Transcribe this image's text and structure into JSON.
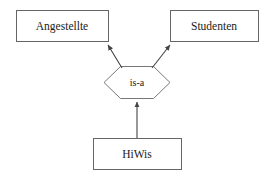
{
  "diagram": {
    "type": "er-is-a-generalization",
    "background_color": "#ffffff",
    "stroke_color": "#555555",
    "text_color": "#1a1a1a",
    "entities": [
      {
        "id": "angestellte",
        "label": "Angestellte",
        "shape": "rectangle",
        "x": 16,
        "y": 10,
        "width": 92,
        "height": 32
      },
      {
        "id": "studenten",
        "label": "Studenten",
        "shape": "rectangle",
        "x": 170,
        "y": 10,
        "width": 88,
        "height": 32
      },
      {
        "id": "hiwis",
        "label": "HiWis",
        "shape": "rectangle",
        "x": 93,
        "y": 138,
        "width": 88,
        "height": 32
      }
    ],
    "relationships": [
      {
        "id": "is-a",
        "label": "is-a",
        "shape": "hexagon",
        "x": 104,
        "y": 66,
        "width": 66,
        "height": 32
      }
    ],
    "edges": [
      {
        "id": "hiwis-to-isa",
        "from": "hiwis",
        "to": "is-a",
        "arrow": "target",
        "x1": 137,
        "y1": 138,
        "x2": 137,
        "y2": 99
      },
      {
        "id": "isa-to-angestellte",
        "from": "is-a",
        "to": "angestellte",
        "arrow": "target",
        "x1": 121,
        "y1": 67,
        "x2": 106,
        "y2": 43
      },
      {
        "id": "isa-to-studenten",
        "from": "is-a",
        "to": "studenten",
        "arrow": "target",
        "x1": 153,
        "y1": 67,
        "x2": 172,
        "y2": 43
      }
    ]
  }
}
